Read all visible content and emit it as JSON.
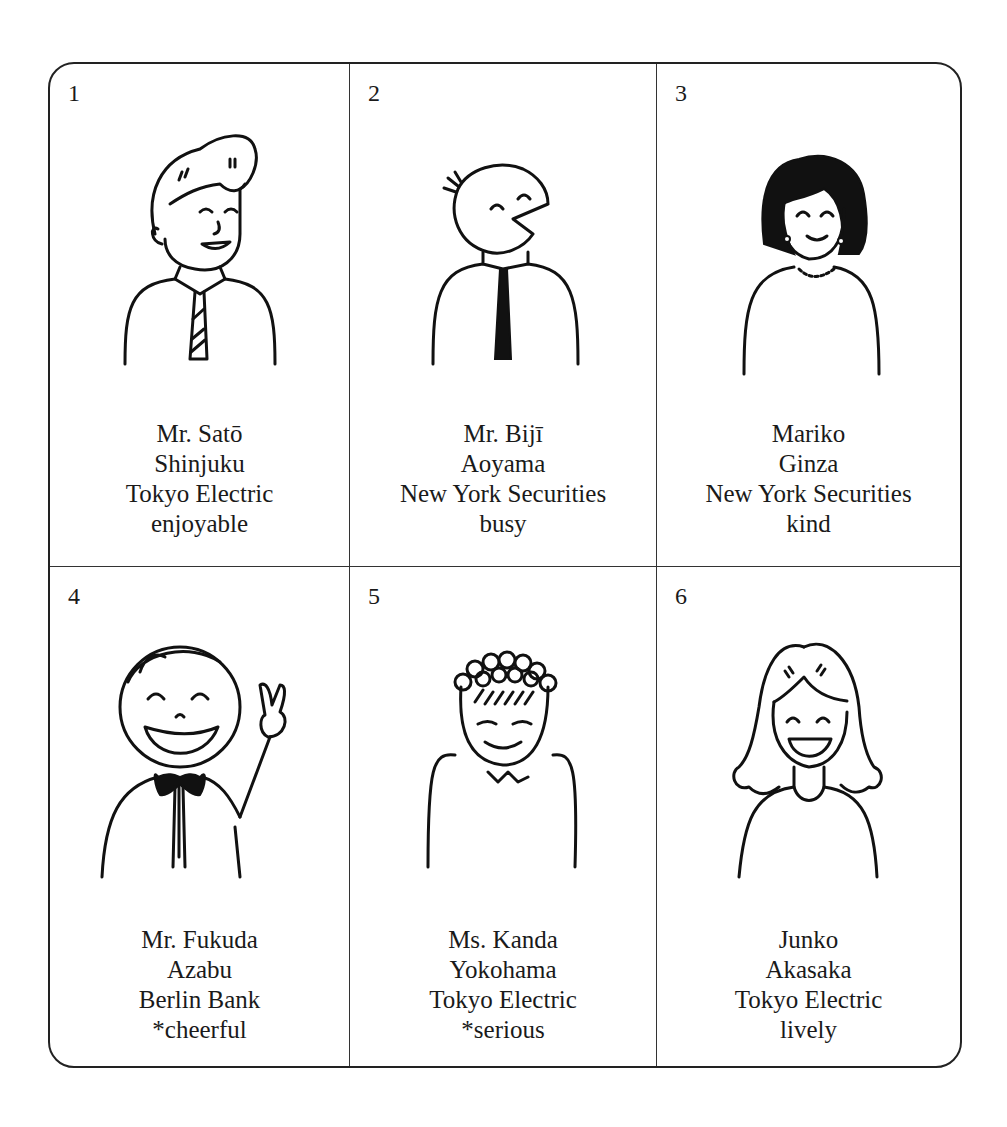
{
  "cards": [
    {
      "number": "1",
      "name": "Mr. Satō",
      "place": "Shinjuku",
      "company": "Tokyo Electric",
      "trait": "enjoyable",
      "illustration": "smiling-man-with-striped-tie"
    },
    {
      "number": "2",
      "name": "Mr. Bijī",
      "place": "Aoyama",
      "company": "New York Securities",
      "trait": "busy",
      "illustration": "round-head-man-with-black-tie"
    },
    {
      "number": "3",
      "name": "Mariko",
      "place": "Ginza",
      "company": "New York Securities",
      "trait": "kind",
      "illustration": "woman-with-dark-hair-and-pearl-necklace"
    },
    {
      "number": "4",
      "name": "Mr. Fukuda",
      "place": "Azabu",
      "company": "Berlin Bank",
      "trait": "*cheerful",
      "illustration": "laughing-man-with-bow-tie-peace-sign"
    },
    {
      "number": "5",
      "name": "Ms. Kanda",
      "place": "Yokohama",
      "company": "Tokyo Electric",
      "trait": "*serious",
      "illustration": "curly-haired-person-eyes-closed"
    },
    {
      "number": "6",
      "name": "Junko",
      "place": "Akasaka",
      "company": "Tokyo Electric",
      "trait": "lively",
      "illustration": "laughing-woman-with-wavy-hair"
    }
  ]
}
